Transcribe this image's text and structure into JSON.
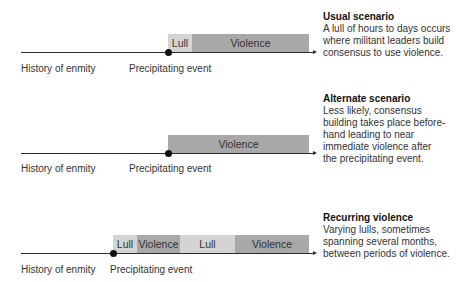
{
  "scenarios": [
    {
      "title": "Usual scenario",
      "description_lines": [
        "A lull of hours to days occurs",
        "where militant leaders build",
        "consensus to use violence."
      ],
      "labels": {
        "history": "History of enmity",
        "event": "Precipitating event"
      },
      "segments": [
        {
          "type": "lull",
          "label": "Lull"
        },
        {
          "type": "violence",
          "label": "Violence"
        }
      ]
    },
    {
      "title": "Alternate scenario",
      "description_lines": [
        "Less likely, consensus",
        "building takes place before-",
        "hand leading to near",
        "immediate violence after",
        "the precipitating event."
      ],
      "labels": {
        "history": "History of enmity",
        "event": "Precipitating event"
      },
      "segments": [
        {
          "type": "violence",
          "label": "Violence"
        }
      ]
    },
    {
      "title": "Recurring violence",
      "description_lines": [
        "Varying lulls, sometimes",
        "spanning several months,",
        "between periods of violence."
      ],
      "labels": {
        "history": "History of enmity",
        "event": "Precipitating event"
      },
      "segments": [
        {
          "type": "lull",
          "label": "Lull"
        },
        {
          "type": "violence",
          "label": "Violence"
        },
        {
          "type": "lull",
          "label": "Lull"
        },
        {
          "type": "violence",
          "label": "Violence"
        }
      ]
    }
  ],
  "colors": {
    "lull": "#d4d4d4",
    "violence": "#a8a8a8",
    "axis": "#2a2a2a"
  }
}
